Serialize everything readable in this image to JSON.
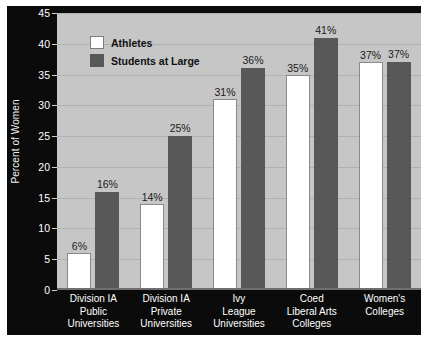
{
  "chart_data": {
    "type": "bar",
    "title": "",
    "xlabel": "",
    "ylabel": "Percent of Women",
    "ylim": [
      0,
      45
    ],
    "ytick_step": 5,
    "yticks": [
      "45",
      "40",
      "35",
      "30",
      "25",
      "20",
      "15",
      "10",
      "5",
      "0"
    ],
    "grid": true,
    "legend_position": "top-left-inside",
    "categories": [
      "Division IA\nPublic\nUniversities",
      "Division IA\nPrivate\nUniversities",
      "Ivy\nLeague\nUniversities",
      "Coed\nLiberal Arts\nColleges",
      "Women's\nColleges"
    ],
    "category_lines": [
      [
        "Division IA",
        "Public",
        "Universities"
      ],
      [
        "Division IA",
        "Private",
        "Universities"
      ],
      [
        "Ivy",
        "League",
        "Universities"
      ],
      [
        "Coed",
        "Liberal Arts",
        "Colleges"
      ],
      [
        "Women's",
        "Colleges"
      ]
    ],
    "series": [
      {
        "name": "Athletes",
        "color": "#ffffff",
        "values": [
          6,
          14,
          31,
          35,
          37
        ],
        "labels": [
          "6%",
          "14%",
          "31%",
          "35%",
          "37%"
        ]
      },
      {
        "name": "Students at Large",
        "color": "#585858",
        "values": [
          16,
          25,
          36,
          41,
          37
        ],
        "labels": [
          "16%",
          "25%",
          "36%",
          "41%",
          "37%"
        ]
      }
    ]
  },
  "legend": {
    "items": [
      {
        "label": "Athletes",
        "swatch": "white-swatch-icon"
      },
      {
        "label": "Students at Large",
        "swatch": "dark-gray-swatch-icon"
      }
    ]
  },
  "colors": {
    "frame": "#0b0b0b",
    "plot_background": "#c6c6c6",
    "gridline": "#b0b0b0",
    "athletes_bar": "#ffffff",
    "students_bar": "#585858",
    "axis_text": "#ffffff",
    "data_label_text": "#1a1a1a"
  }
}
